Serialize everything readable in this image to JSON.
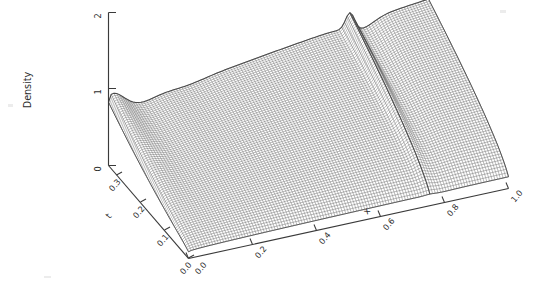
{
  "figure": {
    "kind": "3d-surface-mesh-plot",
    "background_color": "#ffffff",
    "ink_color": "#3a3a3a",
    "mesh_color": "#4a4a4a",
    "width": 548,
    "height": 286
  },
  "chart_data": {
    "type": "surface",
    "title": "",
    "subtitle": "",
    "zlabel": "Density",
    "xlabel": "x",
    "ylabel": "t",
    "grid": false,
    "legend": null,
    "legend_position": "none",
    "xlim": [
      0.0,
      1.0
    ],
    "ylim": [
      0.0,
      0.3
    ],
    "zlim": [
      0,
      2
    ],
    "xticks": [
      "0.0",
      "0.2",
      "0.4",
      "0.6",
      "0.8",
      "1.0"
    ],
    "xtick_values": [
      0.0,
      0.2,
      0.4,
      0.6,
      0.8,
      1.0
    ],
    "yticks": [
      "0.0",
      "0.1",
      "0.2",
      "0.3"
    ],
    "ytick_values": [
      0.0,
      0.1,
      0.2,
      0.3
    ],
    "zticks": [
      "0",
      "1",
      "2"
    ],
    "ztick_values": [
      0,
      1,
      2
    ],
    "x": [
      0.0,
      1.0
    ],
    "y": [
      0.0,
      0.3
    ],
    "annotations": []
  },
  "axes": {
    "z": {
      "title": "Density",
      "title_rotation_deg": -90,
      "ticks": [
        {
          "label": "2",
          "value": 2
        },
        {
          "label": "1",
          "value": 1
        },
        {
          "label": "0",
          "value": 0
        }
      ]
    },
    "t": {
      "title": "t",
      "ticks": [
        {
          "label": "0.3",
          "value": 0.3
        },
        {
          "label": "0.2",
          "value": 0.2
        },
        {
          "label": "0.1",
          "value": 0.1
        },
        {
          "label": "0.0",
          "value": 0.0
        }
      ]
    },
    "x": {
      "title": "x",
      "ticks": [
        {
          "label": "0.0",
          "value": 0.0
        },
        {
          "label": "0.2",
          "value": 0.2
        },
        {
          "label": "0.4",
          "value": 0.4
        },
        {
          "label": "0.6",
          "value": 0.6
        },
        {
          "label": "0.8",
          "value": 0.8
        },
        {
          "label": "1.0",
          "value": 1.0
        }
      ]
    }
  }
}
